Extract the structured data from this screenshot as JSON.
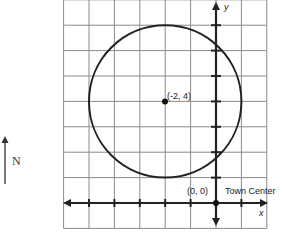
{
  "diagram": {
    "type": "coordinate-grid",
    "grid": {
      "x_min": -6,
      "x_max": 2,
      "y_min": -1,
      "y_max": 8,
      "step": 1
    },
    "axes": {
      "x_label": "x",
      "y_label": "y",
      "x_ticks": [
        -5,
        -4,
        -3,
        -2,
        -1,
        1
      ],
      "y_ticks": [
        1,
        2,
        3,
        4,
        5,
        6,
        7
      ]
    },
    "circle": {
      "center": [
        -2,
        4
      ],
      "radius": 3
    },
    "points": [
      {
        "coords": [
          -2,
          4
        ],
        "label": "(-2, 4)"
      },
      {
        "coords": [
          0,
          0
        ],
        "label": "(0, 0)"
      }
    ],
    "origin_label": "(0, 0)",
    "center_label": "(-2, 4)",
    "town_center_label": "Town Center",
    "compass": {
      "label": "N",
      "direction": "north-icon"
    },
    "colors": {
      "ink": "#222222",
      "grid": "#8a8a8a",
      "background": "#ffffff"
    }
  }
}
